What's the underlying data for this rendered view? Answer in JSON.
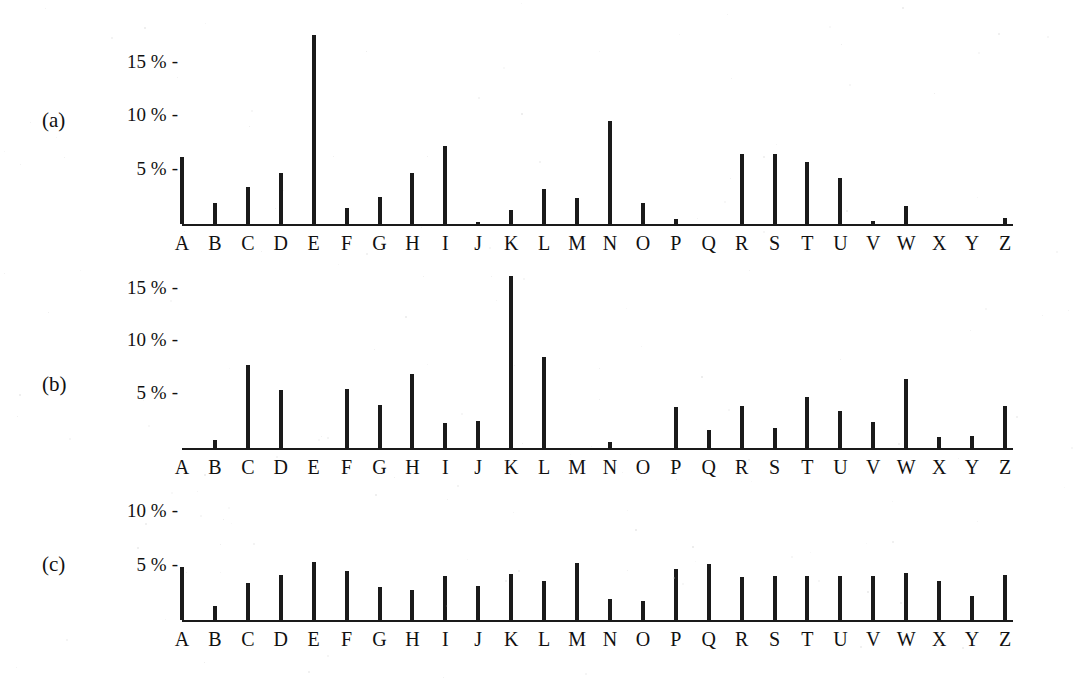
{
  "figure": {
    "alphabet": [
      "A",
      "B",
      "C",
      "D",
      "E",
      "F",
      "G",
      "H",
      "I",
      "J",
      "K",
      "L",
      "M",
      "N",
      "O",
      "P",
      "Q",
      "R",
      "S",
      "T",
      "U",
      "V",
      "W",
      "X",
      "Y",
      "Z"
    ],
    "bar_color": "#1a1a1a",
    "axis_color": "#1a1a1a",
    "background": "#ffffff",
    "percent_symbol": "%",
    "tick_dash": "-"
  },
  "panels": [
    {
      "tag": "(a)",
      "ytick_labels": [
        "15 %",
        "10 %",
        "5 %"
      ],
      "ytick_values": [
        15,
        10,
        5
      ]
    },
    {
      "tag": "(b)",
      "ytick_labels": [
        "15 %",
        "10 %",
        "5 %"
      ],
      "ytick_values": [
        15,
        10,
        5
      ]
    },
    {
      "tag": "(c)",
      "ytick_labels": [
        "10 %",
        "5 %"
      ],
      "ytick_values": [
        10,
        5
      ]
    }
  ],
  "chart_data": [
    {
      "type": "bar",
      "title": "(a)",
      "xlabel": "",
      "ylabel": "",
      "ylim": [
        0,
        18
      ],
      "grid": false,
      "legend": "none",
      "yticks": [
        5,
        10,
        15
      ],
      "ytick_labels": [
        "5 %",
        "10 %",
        "15 %"
      ],
      "categories": [
        "A",
        "B",
        "C",
        "D",
        "E",
        "F",
        "G",
        "H",
        "I",
        "J",
        "K",
        "L",
        "M",
        "N",
        "O",
        "P",
        "Q",
        "R",
        "S",
        "T",
        "U",
        "V",
        "W",
        "X",
        "Y",
        "Z"
      ],
      "values": [
        6.3,
        2.0,
        3.5,
        4.8,
        17.7,
        1.5,
        2.5,
        4.8,
        7.3,
        0.2,
        1.3,
        3.3,
        2.4,
        9.6,
        2.0,
        0.5,
        0.0,
        6.5,
        6.5,
        5.8,
        4.3,
        0.3,
        1.7,
        0.0,
        0.0,
        0.6
      ]
    },
    {
      "type": "bar",
      "title": "(b)",
      "xlabel": "",
      "ylabel": "",
      "ylim": [
        0,
        18
      ],
      "grid": false,
      "legend": "none",
      "yticks": [
        5,
        10,
        15
      ],
      "ytick_labels": [
        "5 %",
        "10 %",
        "15 %"
      ],
      "categories": [
        "A",
        "B",
        "C",
        "D",
        "E",
        "F",
        "G",
        "H",
        "I",
        "J",
        "K",
        "L",
        "M",
        "N",
        "O",
        "P",
        "Q",
        "R",
        "S",
        "T",
        "U",
        "V",
        "W",
        "X",
        "Y",
        "Z"
      ],
      "values": [
        0.0,
        0.8,
        7.9,
        5.5,
        0.0,
        5.6,
        4.1,
        7.0,
        2.4,
        2.6,
        16.3,
        8.6,
        0.0,
        0.6,
        0.0,
        3.9,
        1.7,
        4.0,
        1.9,
        4.8,
        3.5,
        2.5,
        6.5,
        1.0,
        1.1,
        4.0
      ]
    },
    {
      "type": "bar",
      "title": "(c)",
      "xlabel": "",
      "ylabel": "",
      "ylim": [
        0,
        11
      ],
      "grid": false,
      "legend": "none",
      "yticks": [
        5,
        10
      ],
      "ytick_labels": [
        "5 %",
        "10 %"
      ],
      "categories": [
        "A",
        "B",
        "C",
        "D",
        "E",
        "F",
        "G",
        "H",
        "I",
        "J",
        "K",
        "L",
        "M",
        "N",
        "O",
        "P",
        "Q",
        "R",
        "S",
        "T",
        "U",
        "V",
        "W",
        "X",
        "Y",
        "Z"
      ],
      "values": [
        5.0,
        1.3,
        3.5,
        4.2,
        5.4,
        4.6,
        3.1,
        2.8,
        4.1,
        3.2,
        4.3,
        3.6,
        5.3,
        2.0,
        1.8,
        4.8,
        5.2,
        4.0,
        4.1,
        4.1,
        4.1,
        4.1,
        4.4,
        3.6,
        2.2,
        4.2
      ]
    }
  ]
}
